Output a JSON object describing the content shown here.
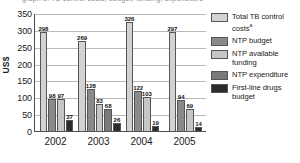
{
  "chart_data": {
    "type": "bar",
    "title": "",
    "xlabel": "",
    "ylabel": "US$",
    "ylim": [
      0,
      350
    ],
    "ytick_step": 50,
    "yticks": [
      350,
      300,
      250,
      200,
      150,
      100,
      50,
      0
    ],
    "grid": true,
    "legend_position": "right",
    "categories": [
      "2002",
      "2003",
      "2004",
      "2005"
    ],
    "series": [
      {
        "name": "Total TB control costs",
        "name_superscript": "a",
        "color": "#d2d2d2",
        "values": [
          298,
          269,
          326,
          297
        ]
      },
      {
        "name": "NTP budget",
        "color": "#8a8a8a",
        "values": [
          98,
          128,
          122,
          94
        ]
      },
      {
        "name": "NTP available funding",
        "color": "#c6c6c6",
        "values": [
          97,
          83,
          103,
          69
        ]
      },
      {
        "name": "NTP expenditure",
        "color": "#7a7a7a",
        "values": [
          null,
          68,
          null,
          null
        ]
      },
      {
        "name": "First-line drugs budget",
        "color": "#2b2b2b",
        "values": [
          37,
          26,
          19,
          14
        ]
      }
    ]
  },
  "top_cut_text": "graph of TB control costs, budget, funding, expenditure",
  "legend": {
    "items": [
      {
        "label": "Total TB control",
        "label2": "costs",
        "sup": "a"
      },
      {
        "label": "NTP budget",
        "label2": "",
        "sup": ""
      },
      {
        "label": "NTP available",
        "label2": "funding",
        "sup": ""
      },
      {
        "label": "NTP expenditure",
        "label2": "",
        "sup": ""
      },
      {
        "label": "First-line drugs",
        "label2": "budget",
        "sup": ""
      }
    ]
  }
}
